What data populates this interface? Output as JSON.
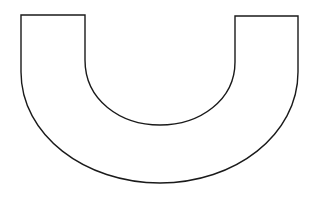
{
  "diagram": {
    "shape": "u-shape-outline",
    "stroke_color": "#1a1a1a",
    "fill_color": "#ffffff",
    "background": "#ffffff",
    "outer": {
      "left_x": 21,
      "right_x": 298,
      "top_y": 15,
      "bottom_y": 183
    },
    "inner": {
      "left_x": 85,
      "right_x": 235,
      "top_y": 16,
      "bottom_y": 125
    }
  }
}
